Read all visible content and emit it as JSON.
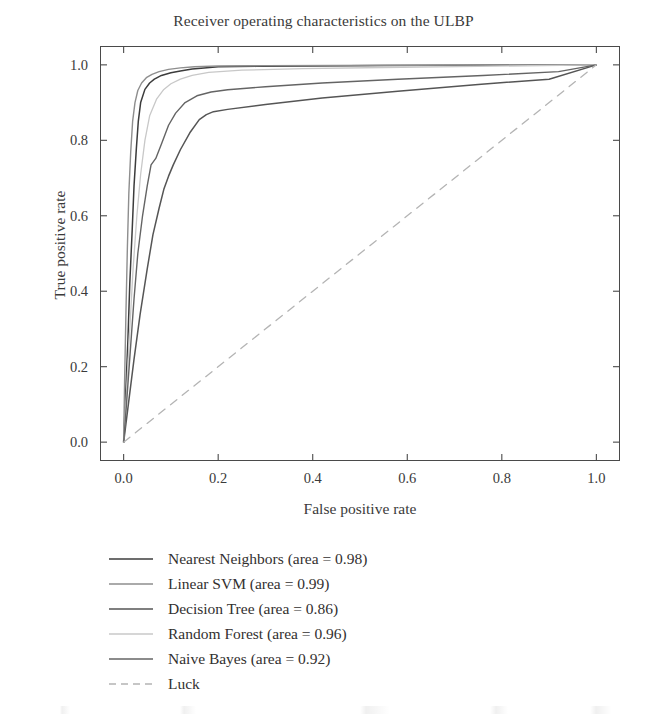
{
  "chart_data": {
    "type": "line",
    "title": "Receiver operating characteristics on the ULBP",
    "xlabel": "False positive rate",
    "ylabel": "True positive rate",
    "xlim": [
      -0.05,
      1.05
    ],
    "ylim": [
      -0.05,
      1.05
    ],
    "xticks": [
      "0.0",
      "0.2",
      "0.4",
      "0.6",
      "0.8",
      "1.0"
    ],
    "xtick_values": [
      0.0,
      0.2,
      0.4,
      0.6,
      0.8,
      1.0
    ],
    "yticks": [
      "0.0",
      "0.2",
      "0.4",
      "0.6",
      "0.8",
      "1.0"
    ],
    "ytick_values": [
      0.0,
      0.2,
      0.4,
      0.6,
      0.8,
      1.0
    ],
    "grid": false,
    "legend_position": "below-axes-left",
    "series": [
      {
        "name": "Nearest Neighbors",
        "label": "Nearest Neighbors (area = 0.98)",
        "area": 0.98,
        "color": "#3c3c3c",
        "dash": "none",
        "width": 1.5,
        "x": [
          0.0,
          0.004,
          0.009,
          0.013,
          0.018,
          0.022,
          0.027,
          0.031,
          0.036,
          0.045,
          0.055,
          0.065,
          0.08,
          0.1,
          0.12,
          0.145,
          0.17,
          0.2,
          0.28,
          0.4,
          0.55,
          0.72,
          0.88,
          1.0
        ],
        "y": [
          0.0,
          0.12,
          0.27,
          0.42,
          0.56,
          0.68,
          0.78,
          0.85,
          0.9,
          0.935,
          0.952,
          0.962,
          0.972,
          0.979,
          0.984,
          0.989,
          0.992,
          0.995,
          0.996,
          0.997,
          0.998,
          0.999,
          0.9995,
          1.0
        ]
      },
      {
        "name": "Linear SVM",
        "label": "Linear SVM (area = 0.99)",
        "area": 0.99,
        "color": "#8e8e8e",
        "dash": "none",
        "width": 1.4,
        "x": [
          0.0,
          0.002,
          0.005,
          0.008,
          0.011,
          0.015,
          0.019,
          0.024,
          0.03,
          0.038,
          0.048,
          0.06,
          0.075,
          0.095,
          0.12,
          0.15,
          0.2,
          0.3,
          0.45,
          0.6,
          0.78,
          1.0
        ],
        "y": [
          0.0,
          0.16,
          0.35,
          0.52,
          0.66,
          0.77,
          0.85,
          0.9,
          0.932,
          0.952,
          0.966,
          0.975,
          0.982,
          0.988,
          0.992,
          0.995,
          0.997,
          0.998,
          0.9985,
          0.999,
          0.9995,
          1.0
        ]
      },
      {
        "name": "Decision Tree",
        "label": "Decision Tree (area = 0.86)",
        "area": 0.86,
        "color": "#555555",
        "dash": "none",
        "width": 1.5,
        "x": [
          0.0,
          0.01,
          0.022,
          0.035,
          0.05,
          0.062,
          0.075,
          0.085,
          0.095,
          0.105,
          0.12,
          0.14,
          0.16,
          0.175,
          0.19,
          0.22,
          0.3,
          0.42,
          0.58,
          0.75,
          0.9,
          1.0
        ],
        "y": [
          0.0,
          0.1,
          0.22,
          0.34,
          0.46,
          0.55,
          0.62,
          0.67,
          0.705,
          0.735,
          0.775,
          0.82,
          0.855,
          0.868,
          0.876,
          0.882,
          0.895,
          0.912,
          0.93,
          0.948,
          0.962,
          1.0
        ]
      },
      {
        "name": "Random Forest",
        "label": "Random Forest (area = 0.96)",
        "area": 0.96,
        "color": "#c8c8c8",
        "dash": "none",
        "width": 1.3,
        "x": [
          0.0,
          0.006,
          0.013,
          0.02,
          0.028,
          0.036,
          0.045,
          0.055,
          0.07,
          0.085,
          0.1,
          0.12,
          0.145,
          0.18,
          0.25,
          0.38,
          0.55,
          0.75,
          1.0
        ],
        "y": [
          0.0,
          0.13,
          0.3,
          0.46,
          0.6,
          0.71,
          0.8,
          0.865,
          0.91,
          0.935,
          0.95,
          0.962,
          0.972,
          0.98,
          0.986,
          0.99,
          0.993,
          0.996,
          1.0
        ]
      },
      {
        "name": "Naive Bayes",
        "label": "Naive Bayes (area = 0.92)",
        "area": 0.92,
        "color": "#646464",
        "dash": "none",
        "width": 1.4,
        "x": [
          0.0,
          0.006,
          0.014,
          0.022,
          0.03,
          0.04,
          0.05,
          0.058,
          0.068,
          0.08,
          0.095,
          0.11,
          0.13,
          0.155,
          0.185,
          0.22,
          0.3,
          0.42,
          0.58,
          0.76,
          0.92,
          1.0
        ],
        "y": [
          0.0,
          0.1,
          0.24,
          0.38,
          0.5,
          0.6,
          0.68,
          0.735,
          0.752,
          0.79,
          0.84,
          0.872,
          0.9,
          0.918,
          0.928,
          0.934,
          0.942,
          0.952,
          0.962,
          0.972,
          0.982,
          1.0
        ]
      },
      {
        "name": "Luck",
        "label": "Luck",
        "area": null,
        "color": "#b4b4b4",
        "dash": "8,7",
        "width": 1.3,
        "x": [
          0.0,
          1.0
        ],
        "y": [
          0.0,
          1.0
        ]
      }
    ]
  },
  "legend": {
    "items": [
      {
        "label": "Nearest Neighbors (area = 0.98)"
      },
      {
        "label": "Linear SVM (area = 0.99)"
      },
      {
        "label": "Decision Tree (area = 0.86)"
      },
      {
        "label": "Random Forest (area = 0.96)"
      },
      {
        "label": "Naive Bayes (area = 0.92)"
      },
      {
        "label": "Luck"
      }
    ]
  }
}
